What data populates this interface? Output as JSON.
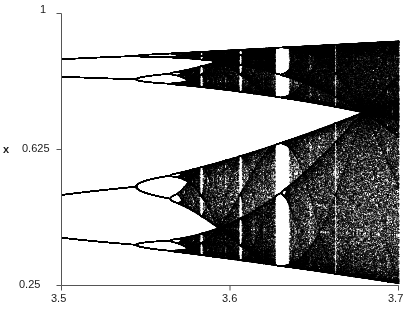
{
  "chart_data": {
    "type": "scatter",
    "title": "",
    "subtitle": "",
    "xlabel": "",
    "ylabel": "x",
    "xlim": [
      3.5,
      3.7
    ],
    "ylim": [
      0.25,
      1.0
    ],
    "xticks": [
      "3.5",
      "3.6",
      "3.7"
    ],
    "xtick_values": [
      3.5,
      3.6,
      3.7
    ],
    "yticks": [
      "1",
      "0.625",
      "0.25"
    ],
    "ytick_values": [
      1.0,
      0.625,
      0.25
    ],
    "grid": false,
    "legend": false,
    "map_equation": "x_{n+1} = r x_n (1 - x_n)",
    "parameter_symbol": "r",
    "iterate_symbol": "x",
    "r_min": 3.5,
    "r_max": 3.7,
    "x_min": 0.25,
    "x_max": 1.0,
    "transient_iterations": 400,
    "plotted_iterations": 260,
    "r_samples": 1100,
    "point_color": "#000000",
    "background_color": "#ffffff",
    "axis_color": "#555555",
    "features": [
      {
        "name": "period-4 regime",
        "r_range": [
          3.5,
          3.544
        ],
        "branches": 4
      },
      {
        "name": "period-8 regime",
        "r_range": [
          3.544,
          3.564
        ],
        "branches": 8
      },
      {
        "name": "period-16 regime",
        "r_range": [
          3.564,
          3.569
        ],
        "branches": 16
      },
      {
        "name": "chaos onset (Feigenbaum accumulation)",
        "r_value": 3.5699
      },
      {
        "name": "four-band chaos",
        "r_range": [
          3.5699,
          3.592
        ]
      },
      {
        "name": "two-band merge",
        "r_value": 3.592
      },
      {
        "name": "periodic window",
        "r_range": [
          3.6265,
          3.6325
        ],
        "period": 6
      },
      {
        "name": "one-band merge",
        "r_value": 3.679
      }
    ],
    "left_edge_branch_values": [
      0.898,
      0.825,
      0.487,
      0.371
    ],
    "approx_attractor_envelope": {
      "upper_at_r_max": 0.925,
      "lower_at_r_max": 0.263
    }
  },
  "axes": {
    "ylabel": "x",
    "ytick_top": "1",
    "ytick_mid": "0.625",
    "ytick_bottom": "0.25",
    "xtick_left": "3.5",
    "xtick_mid": "3.6",
    "xtick_right": "3.7"
  }
}
